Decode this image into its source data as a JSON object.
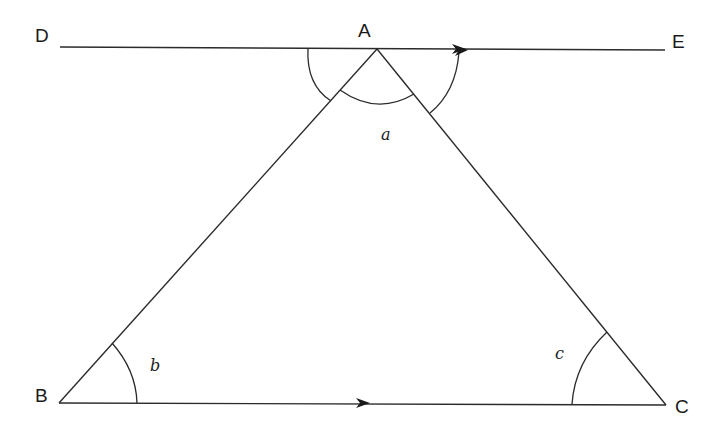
{
  "diagram": {
    "type": "geometry-triangle-parallel-lines",
    "points": {
      "A": {
        "label": "A",
        "x": 377,
        "y": 49
      },
      "B": {
        "label": "B",
        "x": 59,
        "y": 403
      },
      "C": {
        "label": "C",
        "x": 666,
        "y": 405
      },
      "D": {
        "label": "D",
        "x": 60,
        "y": 47
      },
      "E": {
        "label": "E",
        "x": 665,
        "y": 50
      }
    },
    "angles": {
      "a": {
        "label": "a",
        "vertex": "A"
      },
      "b": {
        "label": "b",
        "vertex": "B"
      },
      "c": {
        "label": "c",
        "vertex": "C"
      }
    },
    "lines": [
      {
        "name": "DE",
        "from": "D",
        "to": "E",
        "parallel_arrow": true
      },
      {
        "name": "BC",
        "from": "B",
        "to": "C",
        "parallel_arrow": true
      },
      {
        "name": "AB",
        "from": "A",
        "to": "B"
      },
      {
        "name": "AC",
        "from": "A",
        "to": "C"
      }
    ],
    "colors": {
      "stroke": "#2b2b2b",
      "background": "#ffffff"
    }
  }
}
